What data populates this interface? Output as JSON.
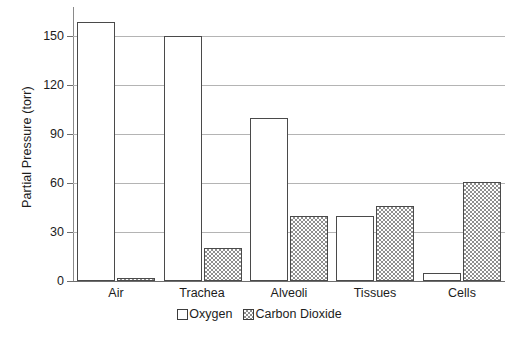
{
  "chart_data": {
    "type": "bar",
    "title": "",
    "xlabel": "",
    "ylabel": "Partial Pressure (torr)",
    "categories": [
      "Air",
      "Trachea",
      "Alveoli",
      "Tissues",
      "Cells"
    ],
    "series": [
      {
        "name": "Oxygen",
        "values": [
          159,
          150,
          100,
          40,
          5
        ]
      },
      {
        "name": "Carbon Dioxide",
        "values": [
          2,
          20,
          40,
          46,
          61
        ]
      }
    ],
    "ylim": [
      0,
      168
    ],
    "yticks": [
      0,
      30,
      60,
      90,
      120,
      150
    ],
    "ytick_labels": [
      "0",
      "30",
      "60",
      "90",
      "120",
      "150"
    ],
    "grid": true,
    "legend_position": "bottom-center",
    "legend_entries": [
      "Oxygen",
      "Carbon Dioxide"
    ],
    "colors": {
      "oxygen_fill": "#ffffff",
      "oxygen_edge": "#4a4a4a",
      "co2_fill": "#8f8f8f",
      "co2_edge": "#4a4a4a",
      "gridline": "#b4b4b4",
      "axis": "#6e6e6e",
      "text": "#1c1c1c",
      "background": "#ffffff"
    }
  }
}
